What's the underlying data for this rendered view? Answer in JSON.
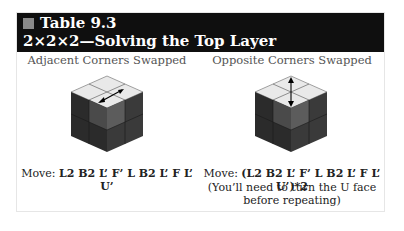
{
  "header": {
    "label": "Table 9.3",
    "title": "2×2×2—Solving the Top Layer"
  },
  "columns": [
    {
      "heading": "Adjacent Corners Swapped",
      "move_prefix": "Move: ",
      "move_sequence": "L2 B2 L’ F’ L B2 L’ F L’ U’",
      "swap_direction": "diagonal",
      "note_lines": []
    },
    {
      "heading": "Opposite Corners Swapped",
      "move_prefix": "Move: ",
      "move_sequence": "(L2 B2 L’ F’ L B2 L’ F L’ U’)*2",
      "swap_direction": "vertical",
      "note_lines": [
        "(You’ll need to turn the U face",
        "before repeating)"
      ]
    }
  ],
  "colors": {
    "header_bg": "#0f0f0f",
    "header_square": "#8a8a8a",
    "cube_top": "#e9e9e9",
    "cube_left_dark": "#2b2b2b",
    "cube_left_mid": "#4a4a4a",
    "cube_right_dark": "#3a3a3a",
    "cube_right_mid": "#5c5c5c"
  }
}
